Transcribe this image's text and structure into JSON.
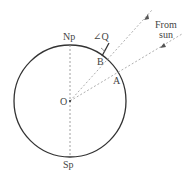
{
  "diagram": {
    "type": "earth-sun-angle",
    "labels": {
      "north_pole": "Np",
      "south_pole": "Sp",
      "center": "O",
      "point_a": "A",
      "point_b": "B",
      "angle": "∠Q",
      "sun_line1": "From",
      "sun_line2": "sun"
    },
    "colors": {
      "circle": "#333333",
      "dashed": "#888888",
      "text": "#444444"
    }
  }
}
